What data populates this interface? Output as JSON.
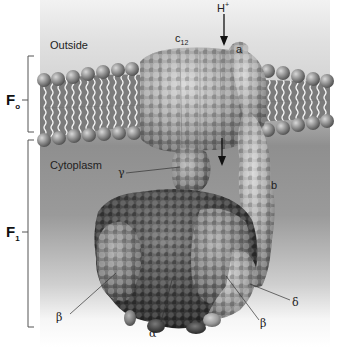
{
  "figure": {
    "regions": {
      "outside_label": "Outside",
      "cytoplasm_label": "Cytoplasm"
    },
    "domains": [
      {
        "id": "Fo",
        "label": "F",
        "subscript": "o"
      },
      {
        "id": "F1",
        "label": "F",
        "subscript": "1"
      }
    ],
    "proton": {
      "label": "H",
      "superscript": "+"
    },
    "subunits": {
      "c": {
        "label": "c",
        "subscript": "12"
      },
      "a": "a",
      "b": "b",
      "gamma": "γ",
      "delta": "δ",
      "alpha": "α",
      "beta_left": "β",
      "beta_right": "β"
    },
    "colors": {
      "outside_bg": "#d9d9d9",
      "cytoplasm_bg": "#8e8e8e",
      "lipid_head": "#8a8a8a",
      "protein_light": "#a8a8a8",
      "protein_dark": "#3a3a3a",
      "bracket": "#555555"
    }
  }
}
